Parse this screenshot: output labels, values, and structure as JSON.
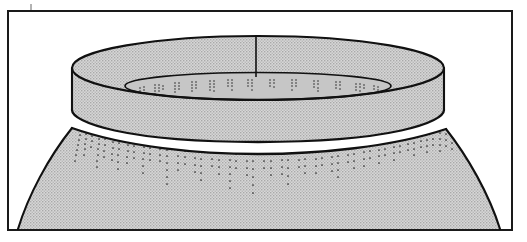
{
  "figure": {
    "domain": "line-drawing",
    "view": "three-quarter perspective from slightly above",
    "title": "",
    "caption": "",
    "label": "",
    "scale_text": "",
    "background_color": "#ffffff",
    "frame": {
      "name": "illustration-border",
      "stroke_color": "#1a1a1a",
      "stroke_width": 2,
      "x": 8,
      "y": 11,
      "width": 504,
      "height": 219,
      "fill": "none"
    },
    "tick_mark": {
      "name": "registration-tick",
      "x": 31,
      "y_top": 5,
      "y_bottom": 11,
      "stroke_color": "#555555",
      "stroke_width": 1
    },
    "fill": {
      "body_tone": "#c9c9c9",
      "collar_tone": "#c9c9c9",
      "inner_rim_tone": "#cfcfcf",
      "stipple_dot_color": "#8f8f8f",
      "stipple_opacity": 0.55
    },
    "outline": {
      "color": "#111111",
      "width_outer": 2.1,
      "width_inner": 1.6,
      "seam_width": 1.5
    },
    "parts": [
      {
        "name": "collar-outer-band",
        "label": "Collar / neck band",
        "top_ellipse_center_x": 258,
        "top_ellipse_center_y": 68,
        "top_ellipse_rx": 186,
        "top_ellipse_ry": 32,
        "band_height": 59
      },
      {
        "name": "collar-inner-rim",
        "label": "Inner rim opening",
        "center_x": 258,
        "center_y": 86,
        "rx": 134,
        "ry": 14
      },
      {
        "name": "vessel-body",
        "label": "Vessel body / shoulder",
        "shoulder_left_x": 72,
        "shoulder_right_x": 446,
        "shoulder_y": 130,
        "base_left_x": 18,
        "base_right_x": 500,
        "base_y": 229
      },
      {
        "name": "vertical-seam",
        "label": "Rim profile seam line",
        "x": 256,
        "y_top": 37,
        "y_bottom": 76
      }
    ],
    "decoration": {
      "name": "stippled-pendant-decoration",
      "style": "punctate / dotted pendant lines",
      "location": "radiating downward from the shoulder join and on the inner rim face",
      "shoulder_line_count": 28,
      "inner_rim_line_count": 22,
      "dot_color": "#2b2b2b",
      "dot_radius": 0.85,
      "min_line_length_px": 8,
      "max_line_length_px": 62
    }
  }
}
